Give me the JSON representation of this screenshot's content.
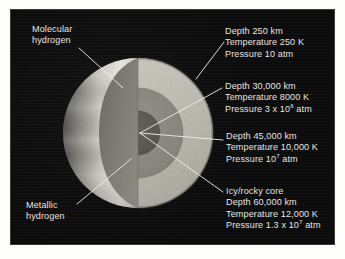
{
  "figure": {
    "background_color": "#ffffff",
    "panel_color": "#0b0b0b",
    "text_color": "#eceae4",
    "leader_line_color": "#f2f0ea"
  },
  "planet": {
    "center_x": 138,
    "center_y": 133,
    "radius": 75,
    "layers": [
      {
        "name": "molecular-hydrogen-layer",
        "outer_radius": 75,
        "color": "#c9c6bc"
      },
      {
        "name": "metallic-hydrogen-layer",
        "outer_radius": 45,
        "color": "#8f8c85"
      },
      {
        "name": "icy-rocky-core",
        "outer_radius": 22,
        "color": "#5e5c57"
      }
    ]
  },
  "left_labels": [
    {
      "name": "molecular-hydrogen",
      "line1": "Molecular",
      "line2": "hydrogen"
    },
    {
      "name": "metallic-hydrogen",
      "line1": "Metallic",
      "line2": "hydrogen"
    }
  ],
  "callouts": [
    {
      "name": "callout-cloud-tops",
      "heading": "",
      "depth": "Depth 250 km",
      "temperature": "Temperature 250 K",
      "pressure_pre": "Pressure 10 atm",
      "pressure_mantissa": "",
      "pressure_exponent": "",
      "pressure_post": ""
    },
    {
      "name": "callout-molecular-metallic-boundary",
      "heading": "",
      "depth": "Depth 30,000 km",
      "temperature": "Temperature 8000 K",
      "pressure_pre": "Pressure 3 x 10",
      "pressure_exponent": "6",
      "pressure_post": " atm"
    },
    {
      "name": "callout-deep-metallic",
      "heading": "",
      "depth": "Depth 45,000 km",
      "temperature": "Temperature 10,000 K",
      "pressure_pre": "Pressure 10",
      "pressure_exponent": "7",
      "pressure_post": " atm"
    },
    {
      "name": "callout-core",
      "heading": "Icy/rocky core",
      "depth": "Depth 60,000 km",
      "temperature": "Temperature 12,000 K",
      "pressure_pre": "Pressure 1.3 x 10",
      "pressure_exponent": "7",
      "pressure_post": " atm"
    }
  ]
}
